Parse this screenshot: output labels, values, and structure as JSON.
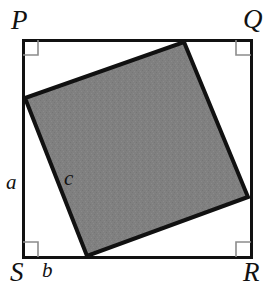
{
  "figure": {
    "outer_square": {
      "name": "PQRS",
      "vertices": [
        {
          "label": "P",
          "x": 23,
          "y": 40,
          "corner": "top-left"
        },
        {
          "label": "Q",
          "x": 251,
          "y": 40,
          "corner": "top-right"
        },
        {
          "label": "R",
          "x": 251,
          "y": 257,
          "corner": "bottom-right"
        },
        {
          "label": "S",
          "x": 23,
          "y": 257,
          "corner": "bottom-left"
        }
      ],
      "stroke_color": "#111111",
      "stroke_width": 3,
      "fill_color": "#ffffff"
    },
    "inner_square": {
      "vertices": [
        {
          "x": 184,
          "y": 42,
          "position": "top"
        },
        {
          "x": 248,
          "y": 197,
          "position": "right"
        },
        {
          "x": 87,
          "y": 256,
          "position": "bottom"
        },
        {
          "x": 25,
          "y": 98,
          "position": "left"
        }
      ],
      "stroke_color": "#111111",
      "stroke_width": 4,
      "fill_color": "#808080"
    },
    "right_angle_marks": {
      "count": 4,
      "size": 15,
      "stroke_color": "#8c8c8c",
      "stroke_width": 1.6,
      "corners": [
        "top-left",
        "top-right",
        "bottom-right",
        "bottom-left"
      ]
    },
    "labels": {
      "P": "P",
      "Q": "Q",
      "R": "R",
      "S": "S",
      "a": "a",
      "b": "b",
      "c": "c"
    },
    "label_roles": {
      "P": "outer-square-vertex-top-left",
      "Q": "outer-square-vertex-top-right",
      "R": "outer-square-vertex-bottom-right",
      "S": "outer-square-vertex-bottom-left",
      "a": "segment-length-left-side-upper",
      "b": "segment-length-bottom-side-left",
      "c": "inner-square-side-length"
    }
  }
}
